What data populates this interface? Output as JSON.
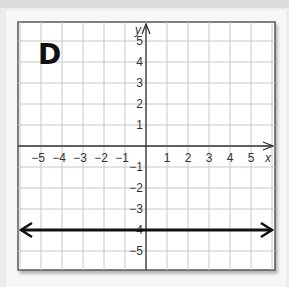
{
  "figure": {
    "label": "D"
  },
  "chart_data": {
    "type": "line",
    "title": "D",
    "xlabel": "x",
    "ylabel": "y",
    "xlim": [
      -6,
      6
    ],
    "ylim": [
      -6,
      6
    ],
    "grid": true,
    "x_ticks": [
      "-5",
      "-4",
      "-3",
      "-2",
      "-1",
      "1",
      "2",
      "3",
      "4",
      "5"
    ],
    "y_ticks": [
      "5",
      "4",
      "3",
      "2",
      "1",
      "-1",
      "-2",
      "-3",
      "-4",
      "-5"
    ],
    "series": [
      {
        "name": "y = -4",
        "x": [
          -6,
          6
        ],
        "y": [
          -4,
          -4
        ],
        "style": "horizontal line with arrows at both ends",
        "color": "#111111"
      }
    ]
  },
  "colors": {
    "grid": "#c8c8c8",
    "axis": "#333333",
    "line": "#111111",
    "frame": "#555555"
  }
}
